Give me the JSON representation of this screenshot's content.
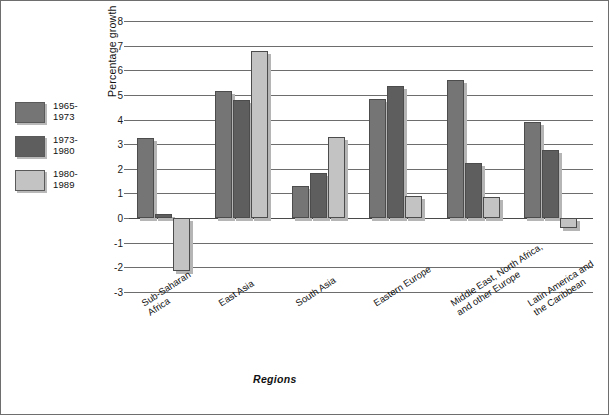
{
  "chart_data": {
    "type": "bar",
    "title": "",
    "xlabel": "Regions",
    "ylabel": "Percentage growth",
    "ylim": [
      -3,
      8
    ],
    "ytick_step": 1,
    "yticks": [
      "8",
      "7",
      "6",
      "5",
      "4",
      "3",
      "2",
      "1",
      "0",
      "-1",
      "-2",
      "-3"
    ],
    "grid": true,
    "legend_position": "left-outside",
    "categories": [
      "Sub-Saharan\nAfrica",
      "East Asia",
      "South Asia",
      "Eastern Europe",
      "Middle East, North Africa,\nand other Europe",
      "Latin America and\nthe Caribbean"
    ],
    "series": [
      {
        "name": "1965-\n1973",
        "color": "#757575",
        "values": [
          3.25,
          5.15,
          1.3,
          4.85,
          5.6,
          3.9
        ]
      },
      {
        "name": "1973-\n1980",
        "color": "#5e5e5e",
        "values": [
          0.15,
          4.8,
          1.85,
          5.35,
          2.25,
          2.75
        ]
      },
      {
        "name": "1980-\n1989",
        "color": "#c3c3c3",
        "values": [
          -2.15,
          6.8,
          3.3,
          0.9,
          0.85,
          -0.4
        ]
      }
    ]
  }
}
